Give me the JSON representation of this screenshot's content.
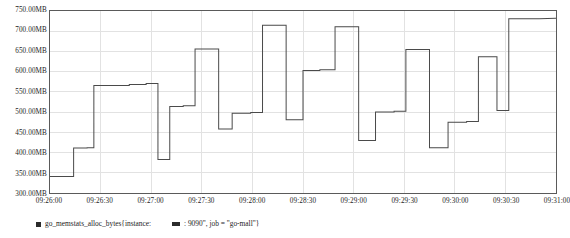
{
  "chart_data": {
    "type": "line",
    "title": "",
    "subtitle": "",
    "xlabel": "",
    "ylabel": "",
    "grid": true,
    "legend_position": "bottom",
    "ylim": [
      300,
      750
    ],
    "yunit": "MB",
    "ytick_labels": [
      "750.00MB",
      "700.00MB",
      "650.00MB",
      "600.00MB",
      "550.00MB",
      "500.00MB",
      "450.00MB",
      "400.00MB",
      "350.00MB",
      "300.00MB"
    ],
    "ytick_values": [
      750,
      700,
      650,
      600,
      550,
      500,
      450,
      400,
      350,
      300
    ],
    "xtick_labels": [
      "09:26:00",
      "09:26:30",
      "09:27:00",
      "09:27:30",
      "09:28:00",
      "09:28:30",
      "09:29:00",
      "09:29:30",
      "09:30:00",
      "09:30:30",
      "09:31:00"
    ],
    "xlim_seconds": [
      0,
      300
    ],
    "series": [
      {
        "name": "go_memstats_alloc_bytes{instance: 9090\", job = \"go-mall\"}",
        "color": "#4a4a4a",
        "points": [
          [
            0,
            341
          ],
          [
            9,
            341
          ],
          [
            14,
            341
          ],
          [
            14,
            411
          ],
          [
            22,
            411
          ],
          [
            22,
            412
          ],
          [
            26,
            412
          ],
          [
            26,
            566
          ],
          [
            47,
            566
          ],
          [
            47,
            568
          ],
          [
            57,
            568
          ],
          [
            57,
            571
          ],
          [
            64,
            571
          ],
          [
            64,
            383
          ],
          [
            71,
            383
          ],
          [
            71,
            514
          ],
          [
            79,
            514
          ],
          [
            79,
            516
          ],
          [
            86,
            516
          ],
          [
            86,
            656
          ],
          [
            100,
            656
          ],
          [
            100,
            458
          ],
          [
            108,
            458
          ],
          [
            108,
            497
          ],
          [
            119,
            497
          ],
          [
            119,
            499
          ],
          [
            126,
            499
          ],
          [
            126,
            715
          ],
          [
            140,
            715
          ],
          [
            140,
            481
          ],
          [
            150,
            481
          ],
          [
            150,
            603
          ],
          [
            160,
            603
          ],
          [
            160,
            605
          ],
          [
            169,
            605
          ],
          [
            169,
            711
          ],
          [
            183,
            711
          ],
          [
            183,
            430
          ],
          [
            193,
            430
          ],
          [
            193,
            500
          ],
          [
            204,
            500
          ],
          [
            204,
            502
          ],
          [
            211,
            502
          ],
          [
            211,
            655
          ],
          [
            225,
            655
          ],
          [
            225,
            412
          ],
          [
            236,
            412
          ],
          [
            236,
            475
          ],
          [
            247,
            475
          ],
          [
            247,
            477
          ],
          [
            254,
            477
          ],
          [
            254,
            637
          ],
          [
            265,
            637
          ],
          [
            265,
            504
          ],
          [
            272,
            504
          ],
          [
            272,
            731
          ],
          [
            290,
            731
          ],
          [
            300,
            732
          ]
        ]
      }
    ],
    "annotations": []
  },
  "legend": {
    "entries": [
      {
        "swatch_shape": "square",
        "color": "#2b2b2b",
        "label": "go_memstats_alloc_bytes{instance:"
      },
      {
        "swatch_shape": "rect",
        "color": "#2b2b2b",
        "label": ": 9090\", job = \"go-mall\"}"
      }
    ]
  }
}
